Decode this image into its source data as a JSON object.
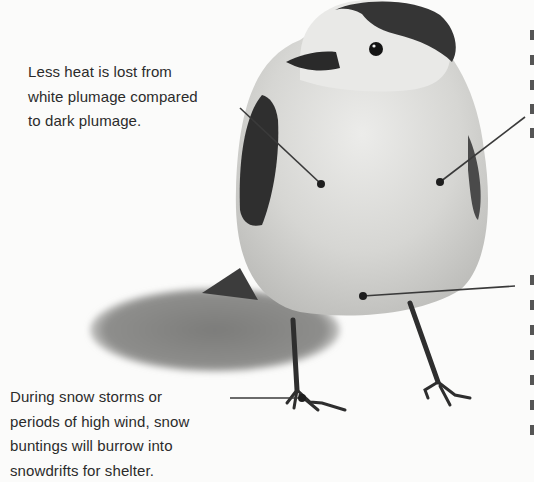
{
  "diagram": {
    "subject": "snow bunting",
    "callouts": [
      {
        "id": "plumage",
        "lines": [
          "Less heat is lost from",
          "white plumage compared",
          "to dark plumage."
        ],
        "target": "breast plumage"
      },
      {
        "id": "shelter",
        "lines": [
          "During snow storms or",
          "periods of high wind, snow",
          "buntings will burrow into",
          "snowdrifts for shelter."
        ],
        "target": "foot"
      },
      {
        "id": "side-right-upper",
        "lines": [],
        "target": "side plumage"
      },
      {
        "id": "side-right-lower",
        "lines": [],
        "target": "belly"
      }
    ],
    "colors": {
      "background": "#fbfbfa",
      "text": "#2b2b2b",
      "leader": "#3a3a3a",
      "dark_plumage": "#3d3d3d",
      "light_plumage": "#d8d8d5",
      "shadow": "#8a8a88"
    }
  }
}
